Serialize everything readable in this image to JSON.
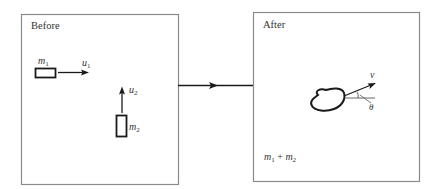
{
  "diagram": {
    "type": "collision-before-after",
    "connector": {
      "direction": "right"
    },
    "before_panel": {
      "title": "Before",
      "objects": [
        {
          "mass_label": "m",
          "mass_sub": "1",
          "velocity_label": "u",
          "velocity_sub": "1",
          "velocity_direction": "right"
        },
        {
          "mass_label": "m",
          "mass_sub": "2",
          "velocity_label": "u",
          "velocity_sub": "2",
          "velocity_direction": "up"
        }
      ]
    },
    "after_panel": {
      "title": "After",
      "combined": {
        "velocity_label": "v",
        "angle_label": "θ"
      },
      "mass_text": {
        "m1": "m",
        "m1_sub": "1",
        "plus": "+",
        "m2": "m",
        "m2_sub": "2"
      }
    }
  },
  "colors": {
    "stroke": "#1a1a1a",
    "frame": "#8a8a8a",
    "text": "#333333"
  }
}
